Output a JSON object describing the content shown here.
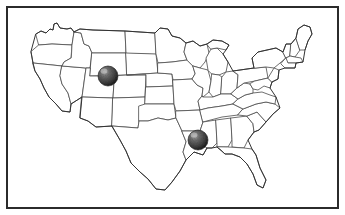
{
  "image": {
    "kind": "us-state-map-with-markers",
    "width": 345,
    "height": 215,
    "background_color": "#ffffff"
  },
  "frame": {
    "border_color": "#2b2b2b",
    "border_width_px": 2,
    "inset_px": 6
  },
  "map": {
    "title": "United States",
    "region": "Contiguous United States",
    "state_boundary_color": "#4a4a4a",
    "coastline_color": "#333333",
    "fill_color": "#ffffff",
    "projection_note": "generalized outline"
  },
  "markers": [
    {
      "id": "marker-1",
      "name": "location-marker-west",
      "label": "Utah / Colorado border region",
      "x": 108,
      "y": 76,
      "radius": 10,
      "style": "textured-sphere",
      "color": "#4d4d4d",
      "highlight_color": "#b0b0b0",
      "shadow_color": "#1c1c1c"
    },
    {
      "id": "marker-2",
      "name": "location-marker-south",
      "label": "Arkansas / Mississippi region",
      "x": 198,
      "y": 140,
      "radius": 10,
      "style": "textured-sphere",
      "color": "#4d4d4d",
      "highlight_color": "#b0b0b0",
      "shadow_color": "#1c1c1c"
    }
  ],
  "legend": {
    "visible": false,
    "items": []
  },
  "labels": {
    "visible": false,
    "items": []
  }
}
